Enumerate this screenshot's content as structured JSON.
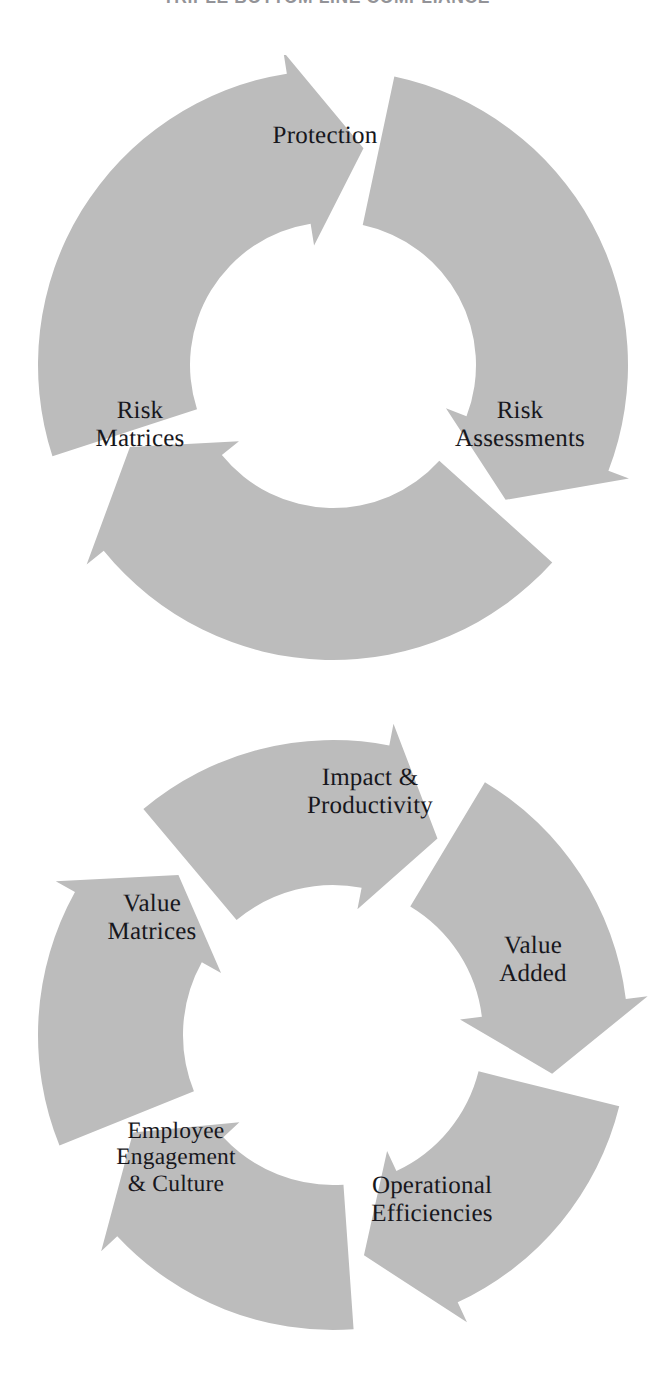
{
  "page": {
    "title": "TRIPLE BOTTOM LINE COMPLIANCE",
    "background_color": "#ffffff",
    "width": 653,
    "height": 1374
  },
  "theme": {
    "segment_fill": "#bcbcbc",
    "gap_color": "#ffffff",
    "text_color": "#17171c"
  },
  "chart_data": {
    "type": "diagram",
    "diagram_type": "cycle",
    "title": "TRIPLE BOTTOM LINE COMPLIANCE",
    "cycles": [
      {
        "name": "compliance-cycle",
        "direction": "clockwise",
        "segment_count": 3,
        "center": {
          "x": 333,
          "y": 365
        },
        "outer_radius": 295,
        "inner_radius": 143,
        "segments": [
          {
            "label": "Protection",
            "position": "top",
            "start_angle": -78,
            "end_angle": 38,
            "label_x": 325,
            "label_y": 136
          },
          {
            "label": "Risk\nAssessments",
            "position": "right",
            "start_angle": 42,
            "end_angle": 158,
            "label_x": 520,
            "label_y": 425
          },
          {
            "label": "Risk\nMatrices",
            "position": "left",
            "start_angle": 162,
            "end_angle": 278,
            "label_x": 140,
            "label_y": 425
          }
        ]
      },
      {
        "name": "value-cycle",
        "direction": "clockwise",
        "segment_count": 5,
        "center": {
          "x": 333,
          "y": 1035
        },
        "outer_radius": 295,
        "inner_radius": 150,
        "segments": [
          {
            "label": "Impact &\nProductivity",
            "position": "top",
            "start_angle": -59,
            "end_angle": 10,
            "label_x": 370,
            "label_y": 792
          },
          {
            "label": "Value\nAdded",
            "position": "right",
            "start_angle": 14,
            "end_angle": 82,
            "label_x": 533,
            "label_y": 960
          },
          {
            "label": "Operational\nEfficiencies",
            "position": "bottom-right",
            "start_angle": 86,
            "end_angle": 154,
            "label_x": 432,
            "label_y": 1200
          },
          {
            "label": "Employee\nEngagement\n& Culture",
            "position": "bottom-left",
            "start_angle": 158,
            "end_angle": 226,
            "label_x": 176,
            "label_y": 1157
          },
          {
            "label": "Value\nMatrices",
            "position": "upper-left",
            "start_angle": 230,
            "end_angle": 298,
            "label_x": 152,
            "label_y": 918
          }
        ]
      }
    ]
  }
}
